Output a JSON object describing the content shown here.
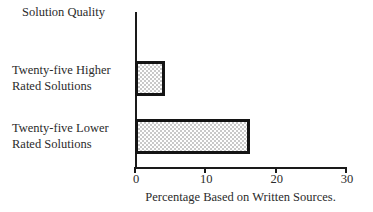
{
  "chart_data": {
    "type": "bar",
    "orientation": "horizontal",
    "title": "Solution Quality",
    "categories": [
      "Twenty-five Higher Rated Solutions",
      "Twenty-five Lower Rated Solutions"
    ],
    "values": [
      4.3,
      16.3
    ],
    "xlabel": "Percentage Based on Written Sources.",
    "ylabel": "Solution Quality",
    "xlim": [
      0,
      30
    ],
    "xticks": [
      0,
      10,
      20,
      30
    ],
    "xtick_labels": [
      "0",
      "10",
      "20",
      "30"
    ],
    "grid": false,
    "legend": false,
    "bar_fill": "#c9c9c9",
    "bar_edge": "#141414",
    "axis_color": "#1a1a1a",
    "background": "#ffffff"
  },
  "category_labels": [
    {
      "line1": "Twenty-five Higher",
      "line2": "Rated Solutions"
    },
    {
      "line1": "Twenty-five Lower",
      "line2": "Rated Solutions"
    }
  ],
  "axis": {
    "title": "Solution Quality",
    "caption": "Percentage Based on Written Sources.",
    "ticks": [
      "0",
      "10",
      "20",
      "30"
    ]
  }
}
